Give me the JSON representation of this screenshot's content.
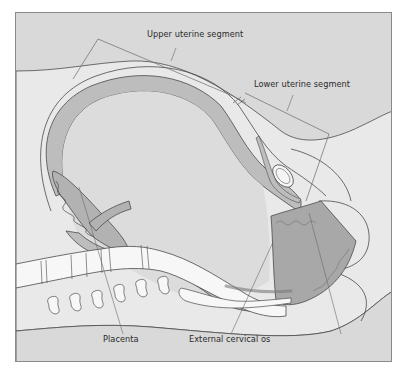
{
  "diagram": {
    "type": "anatomical cross-section",
    "labels": {
      "upper_segment": "Upper uterine segment",
      "lower_segment": "Lower uterine segment",
      "placenta": "Placenta",
      "external_os": "External cervical os"
    },
    "colors": {
      "background": "#d9d9d9",
      "body_light": "#e9e9e9",
      "uterine_wall": "#bdbdbd",
      "cervix_dark": "#a8a8a8",
      "bone": "#f7f7f7",
      "outline": "#4a4a4a",
      "leader": "#6a6a6a"
    }
  }
}
